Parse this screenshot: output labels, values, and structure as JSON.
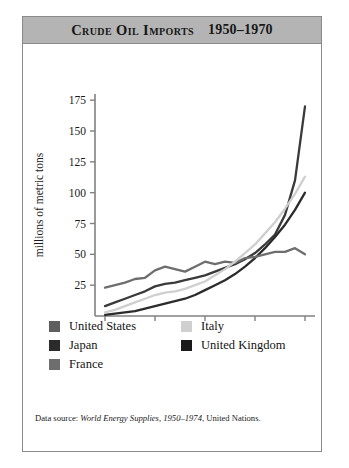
{
  "figure": {
    "title": "Crude Oil Imports",
    "title_range": "1950–1970",
    "source_prefix": "Data source: ",
    "source_italic": "World Energy Supplies, 1950–1974",
    "source_suffix": ", United Nations."
  },
  "legend": {
    "position": "below-plot",
    "left_column": [
      {
        "label": "United States",
        "color": "#5e5e5e"
      },
      {
        "label": "Japan",
        "color": "#2b2b2b"
      },
      {
        "label": "France",
        "color": "#6e6e6e"
      }
    ],
    "right_column": [
      {
        "label": "Italy",
        "color": "#cfcfcf"
      },
      {
        "label": "United Kingdom",
        "color": "#1a1a1a"
      }
    ]
  },
  "chart_data": {
    "type": "line",
    "title": "Crude Oil Imports 1950–1970",
    "xlabel": "years",
    "ylabel": "millions of metric tons",
    "xlim": [
      1949,
      1971
    ],
    "ylim": [
      0,
      180
    ],
    "xticks": [
      1950,
      1955,
      1960,
      1965,
      1970
    ],
    "yticks": [
      25,
      50,
      75,
      100,
      125,
      150,
      175
    ],
    "grid": false,
    "legend_position": "below",
    "x": [
      1950,
      1951,
      1952,
      1953,
      1954,
      1955,
      1956,
      1957,
      1958,
      1959,
      1960,
      1961,
      1962,
      1963,
      1964,
      1965,
      1966,
      1967,
      1968,
      1969,
      1970
    ],
    "series": [
      {
        "name": "United States",
        "color": "#3a3a3a",
        "values": [
          8,
          11,
          14,
          17,
          20,
          24,
          26,
          27,
          29,
          31,
          33,
          36,
          39,
          42,
          46,
          51,
          58,
          66,
          82,
          110,
          170
        ]
      },
      {
        "name": "Japan",
        "color": "#2b2b2b",
        "values": [
          1,
          2,
          3,
          4,
          6,
          8,
          10,
          12,
          14,
          17,
          21,
          25,
          29,
          34,
          40,
          47,
          55,
          64,
          74,
          86,
          100
        ]
      },
      {
        "name": "France",
        "color": "#6e6e6e",
        "values": [
          23,
          25,
          27,
          30,
          31,
          37,
          40,
          38,
          36,
          40,
          44,
          42,
          44,
          43,
          47,
          48,
          50,
          52,
          52,
          55,
          50
        ]
      },
      {
        "name": "Italy",
        "color": "#cfcfcf",
        "values": [
          3,
          5,
          8,
          11,
          14,
          17,
          19,
          20,
          22,
          25,
          28,
          33,
          38,
          44,
          51,
          58,
          67,
          76,
          87,
          99,
          113
        ]
      },
      {
        "name": "United Kingdom",
        "color": "#1a1a1a"
      }
    ]
  }
}
